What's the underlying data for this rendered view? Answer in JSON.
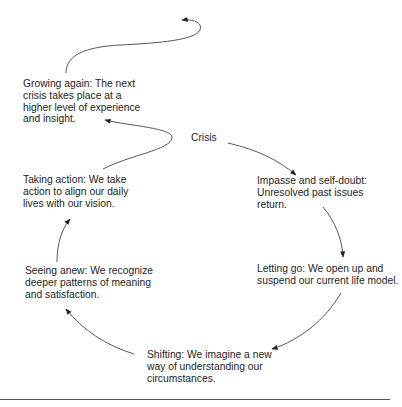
{
  "diagram": {
    "type": "cycle",
    "center_label": "Crisis",
    "stages": [
      {
        "id": "impasse",
        "text": "Impasse and self-doubt:\nUnresolved past issues\nreturn."
      },
      {
        "id": "letting-go",
        "text": "Letting go: We open up and\nsuspend our current life model."
      },
      {
        "id": "shifting",
        "text": "Shifting: We imagine a new\nway of understanding our\ncircumstances."
      },
      {
        "id": "seeing-anew",
        "text": "Seeing anew: We recognize\ndeeper patterns of meaning\nand satisfaction."
      },
      {
        "id": "taking-action",
        "text": "Taking action: We take\naction to align our daily\nlives with our vision."
      },
      {
        "id": "growing-again",
        "text": "Growing again: The next\ncrisis takes place at a\nhigher level of experience\nand insight."
      }
    ],
    "colors": {
      "text": "#1e1e1e",
      "arrow": "#444444",
      "rule": "#555555"
    }
  }
}
